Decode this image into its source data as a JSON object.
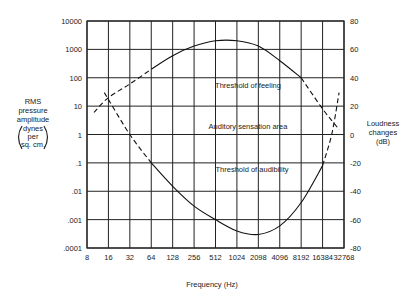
{
  "chart_data": {
    "type": "line",
    "title": "",
    "xlabel": "Frequency (Hz)",
    "ylabel": "RMS pressure amplitude (dynes per sq. cm.)",
    "ylabel_lines": [
      "RMS",
      "pressure",
      "amplitude",
      "dynes",
      "per",
      "sq. cm."
    ],
    "y2label": "Loudness changes (dB)",
    "y2label_lines": [
      "Loudness",
      "changes",
      "(dB)"
    ],
    "x_scale": "log2",
    "y_scale": "log10",
    "x_ticks": [
      "8",
      "16",
      "32",
      "64",
      "128",
      "256",
      "512",
      "1024",
      "2098",
      "4096",
      "8192",
      "16384",
      "32768"
    ],
    "y_ticks": [
      "10000",
      "1000",
      "100",
      "10",
      "1",
      ".1",
      ".01",
      ".001",
      ".0001"
    ],
    "y2_ticks": [
      "80",
      "60",
      "40",
      "20",
      "0",
      "-20",
      "-40",
      "-60",
      "-80"
    ],
    "xlim": [
      8,
      32768
    ],
    "ylim": [
      0.0001,
      10000
    ],
    "y2lim": [
      -80,
      80
    ],
    "grid": true,
    "annotations": [
      {
        "text": "Threshold of feeling",
        "x": 600,
        "y": 40
      },
      {
        "text": "Auditory sensation area",
        "x": 600,
        "y": 1.5
      },
      {
        "text": "Threshold of audibility",
        "x": 1100,
        "y": 0.05
      }
    ],
    "series": [
      {
        "name": "Threshold of feeling",
        "style": "solid with dashed extrapolated ends",
        "x": [
          10,
          16,
          32,
          64,
          128,
          256,
          512,
          1024,
          2048,
          4096,
          8192,
          16384,
          28000
        ],
        "y": [
          6,
          20,
          60,
          200,
          600,
          1300,
          2000,
          2000,
          1300,
          400,
          100,
          8,
          1.5
        ]
      },
      {
        "name": "Threshold of audibility",
        "style": "solid with dashed extrapolated ends",
        "x": [
          14,
          32,
          64,
          128,
          256,
          512,
          1024,
          2048,
          4096,
          8192,
          16384,
          22000,
          28000
        ],
        "y": [
          30,
          1,
          0.1,
          0.015,
          0.003,
          0.001,
          0.0004,
          0.0003,
          0.0006,
          0.004,
          0.08,
          1,
          30
        ]
      }
    ]
  }
}
